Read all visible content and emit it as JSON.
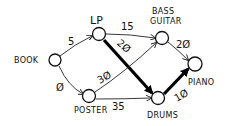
{
  "diagram": {
    "type": "weighted-directed-graph",
    "nodes": [
      {
        "id": "book",
        "label": "BOOK"
      },
      {
        "id": "lp",
        "label": "LP"
      },
      {
        "id": "bass_guitar",
        "label_line1": "BASS",
        "label_line2": "GUITAR"
      },
      {
        "id": "poster",
        "label": "POSTER"
      },
      {
        "id": "drums",
        "label": "DRUMS"
      },
      {
        "id": "piano",
        "label": "PIANO"
      }
    ],
    "edges": [
      {
        "from": "BOOK",
        "to": "LP",
        "weight": "5",
        "highlighted": false
      },
      {
        "from": "BOOK",
        "to": "POSTER",
        "weight": "Ø",
        "highlighted": false
      },
      {
        "from": "LP",
        "to": "BASS GUITAR",
        "weight": "15",
        "highlighted": false
      },
      {
        "from": "LP",
        "to": "DRUMS",
        "weight": "2Ø",
        "highlighted": true
      },
      {
        "from": "POSTER",
        "to": "BASS GUITAR",
        "weight": "3Ø",
        "highlighted": false
      },
      {
        "from": "POSTER",
        "to": "DRUMS",
        "weight": "35",
        "highlighted": false
      },
      {
        "from": "BASS GUITAR",
        "to": "PIANO",
        "weight": "2Ø",
        "highlighted": false
      },
      {
        "from": "DRUMS",
        "to": "PIANO",
        "weight": "1Ø",
        "highlighted": true
      }
    ],
    "colors": {
      "ink": "#111111",
      "background": "#ffffff"
    }
  }
}
